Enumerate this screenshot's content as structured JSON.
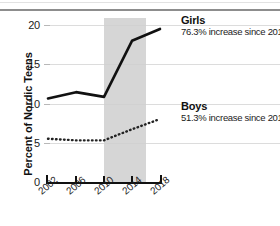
{
  "chart_data": {
    "type": "line",
    "title": "",
    "xlabel": "",
    "ylabel": "Percent of Nordic Teens",
    "x": [
      2002,
      2006,
      2010,
      2014,
      2018
    ],
    "xtick_labels": [
      "2002",
      "2006",
      "2010",
      "2014",
      "2018"
    ],
    "ytick_labels": [
      "0",
      "5",
      "10",
      "15",
      "20"
    ],
    "yticks": [
      0,
      5,
      10,
      15,
      20
    ],
    "ylim": [
      0,
      20
    ],
    "xlim": [
      2002,
      2018
    ],
    "grid": "horizontal",
    "legend_position": "inline-right",
    "shaded_region": {
      "x_start": 2010,
      "x_end": 2016
    },
    "series": [
      {
        "name": "Girls",
        "style": "solid",
        "color": "#111111",
        "values": [
          10.7,
          11.5,
          10.9,
          18.0,
          19.5
        ],
        "annotation": "76.3% increase since 2010"
      },
      {
        "name": "Boys",
        "style": "dotted",
        "color": "#222222",
        "values": [
          5.6,
          5.4,
          5.4,
          6.8,
          8.1
        ],
        "annotation": "51.3% increase since 2010"
      }
    ]
  },
  "axis": {
    "y_title": "Percent of Nordic Teens",
    "y_labels": [
      "20",
      "15",
      "10",
      "5",
      "0"
    ],
    "x_labels": [
      "2002",
      "2006",
      "2010",
      "2014",
      "2018"
    ]
  },
  "annotations": {
    "girls_name": "Girls",
    "girls_detail": "76.3% increase since 2010",
    "boys_name": "Boys",
    "boys_detail": "51.3% increase since 2010"
  }
}
